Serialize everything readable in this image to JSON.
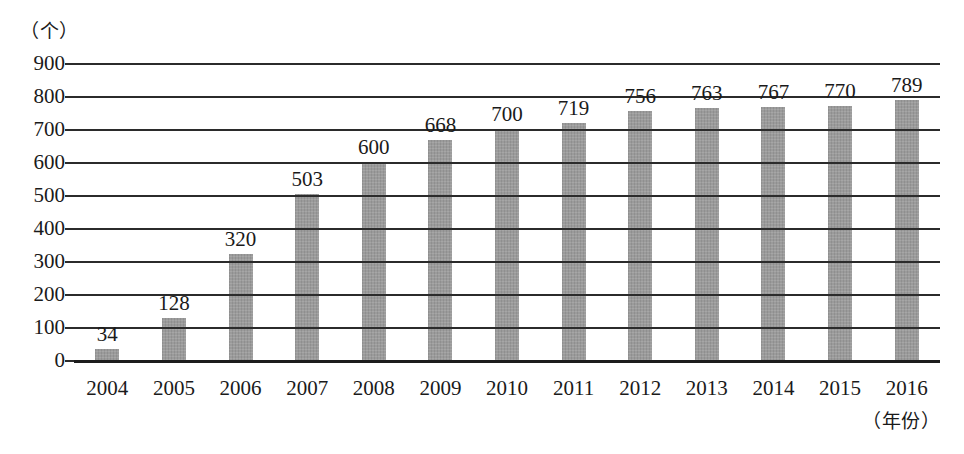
{
  "chart_data": {
    "type": "bar",
    "title": "",
    "subtitle": "",
    "xlabel": "（年份）",
    "ylabel": "（个）",
    "categories": [
      "2004",
      "2005",
      "2006",
      "2007",
      "2008",
      "2009",
      "2010",
      "2011",
      "2012",
      "2013",
      "2014",
      "2015",
      "2016"
    ],
    "values": [
      34,
      128,
      320,
      503,
      600,
      668,
      700,
      719,
      756,
      763,
      767,
      770,
      789
    ],
    "ylim": [
      0,
      900
    ],
    "yticks": [
      0,
      100,
      200,
      300,
      400,
      500,
      600,
      700,
      800,
      900
    ],
    "ytick_labels": [
      "0",
      "100",
      "200",
      "300",
      "400",
      "500",
      "600",
      "700",
      "800",
      "900"
    ],
    "grid": true,
    "legend": false,
    "legend_position": "none",
    "bar_color": "#9d9d9d",
    "gridline_color": "#2b2b2b",
    "background_color": "#ffffff",
    "data_labels": [
      "34",
      "128",
      "320",
      "503",
      "600",
      "668",
      "700",
      "719",
      "756",
      "763",
      "767",
      "770",
      "789"
    ]
  }
}
